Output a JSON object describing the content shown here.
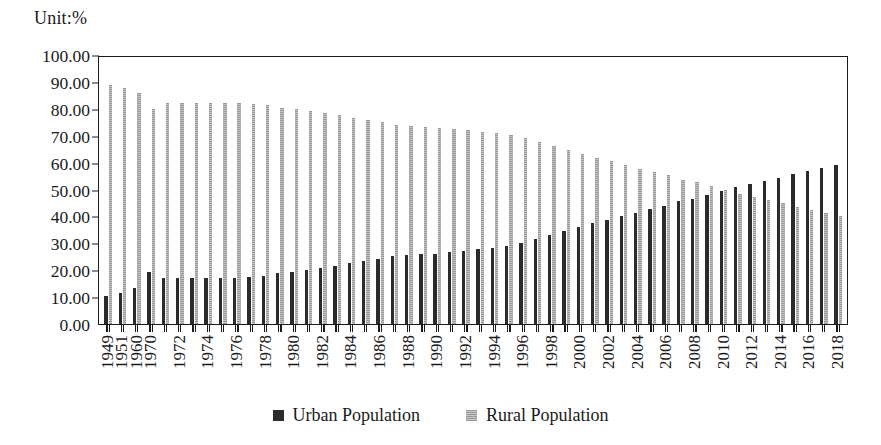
{
  "unit_label": "Unit:%",
  "legend": {
    "position": "bottom-center",
    "items": [
      {
        "label": "Urban Population",
        "color": "#2b2b2b",
        "swatch": "urban"
      },
      {
        "label": "Rural Population",
        "color": "#a8a8a8",
        "swatch": "rural"
      }
    ]
  },
  "axis": {
    "y_ticks": [
      "100.00",
      "90.00",
      "80.00",
      "70.00",
      "60.00",
      "50.00",
      "40.00",
      "30.00",
      "20.00",
      "10.00",
      "0.00"
    ],
    "y_min": 0,
    "y_max": 100,
    "y_step": 10
  },
  "chart_data": {
    "type": "bar",
    "title": "",
    "subtitle": "",
    "xlabel": "",
    "ylabel": "",
    "unit": "%",
    "ylim": [
      0,
      100
    ],
    "ytick_step": 10,
    "grid": false,
    "legend_position": "bottom-center",
    "orientation": "vertical",
    "grouping": "grouped",
    "categories": [
      "1949",
      "1951",
      "1960",
      "1970",
      "1971",
      "1972",
      "1973",
      "1974",
      "1975",
      "1976",
      "1977",
      "1978",
      "1979",
      "1980",
      "1981",
      "1982",
      "1983",
      "1984",
      "1985",
      "1986",
      "1987",
      "1988",
      "1989",
      "1990",
      "1991",
      "1992",
      "1993",
      "1994",
      "1995",
      "1996",
      "1997",
      "1998",
      "1999",
      "2000",
      "2001",
      "2002",
      "2003",
      "2004",
      "2005",
      "2006",
      "2007",
      "2008",
      "2009",
      "2010",
      "2011",
      "2012",
      "2013",
      "2014",
      "2015",
      "2016",
      "2017",
      "2018"
    ],
    "tick_labels_shown": [
      "1949",
      "1951",
      "1960",
      "1970",
      "1972",
      "1974",
      "1976",
      "1978",
      "1980",
      "1982",
      "1984",
      "1986",
      "1988",
      "1990",
      "1992",
      "1994",
      "1996",
      "1998",
      "2000",
      "2002",
      "2004",
      "2006",
      "2008",
      "2010",
      "2012",
      "2014",
      "2016",
      "2018"
    ],
    "series": [
      {
        "name": "Urban Population",
        "color": "#2b2b2b",
        "values": [
          10.64,
          11.78,
          13.5,
          19.4,
          17.3,
          17.1,
          17.2,
          17.2,
          17.3,
          17.4,
          17.5,
          17.92,
          18.96,
          19.39,
          20.16,
          21.13,
          21.62,
          23.01,
          23.71,
          24.52,
          25.32,
          25.81,
          26.21,
          26.41,
          26.94,
          27.46,
          27.99,
          28.51,
          29.04,
          30.48,
          31.91,
          33.35,
          34.78,
          36.22,
          37.66,
          39.09,
          40.53,
          41.76,
          42.99,
          44.34,
          45.89,
          46.99,
          48.34,
          49.95,
          51.27,
          52.57,
          53.73,
          54.77,
          56.1,
          57.35,
          58.52,
          59.58
        ]
      },
      {
        "name": "Rural Population",
        "color": "#a8a8a8",
        "values": [
          89.36,
          88.22,
          86.5,
          80.6,
          82.7,
          82.9,
          82.8,
          82.8,
          82.7,
          82.6,
          82.5,
          82.08,
          81.04,
          80.61,
          79.84,
          78.87,
          78.38,
          76.99,
          76.29,
          75.48,
          74.68,
          74.19,
          73.79,
          73.59,
          73.06,
          72.54,
          72.01,
          71.49,
          70.96,
          69.52,
          68.09,
          66.65,
          65.22,
          63.78,
          62.34,
          60.91,
          59.47,
          58.24,
          57.01,
          55.66,
          54.11,
          53.01,
          51.66,
          50.05,
          48.73,
          47.43,
          46.27,
          45.23,
          43.9,
          42.65,
          41.48,
          40.42
        ]
      }
    ]
  }
}
